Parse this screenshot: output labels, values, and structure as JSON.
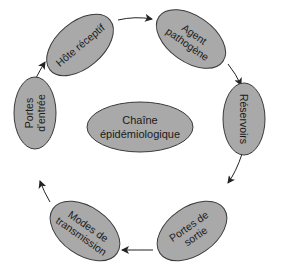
{
  "diagram": {
    "type": "cycle",
    "center": {
      "line1": "Chaîne",
      "line2": "épidémiologique"
    },
    "nodes": [
      {
        "id": "hote",
        "line1": "Hôte réceptif",
        "line2": ""
      },
      {
        "id": "agent",
        "line1": "Agent",
        "line2": "pathogène"
      },
      {
        "id": "reservoirs",
        "line1": "Réservoirs",
        "line2": ""
      },
      {
        "id": "sortie",
        "line1": "Portes de",
        "line2": "sortie"
      },
      {
        "id": "transmission",
        "line1": "Modes de",
        "line2": "transmission"
      },
      {
        "id": "entree",
        "line1": "Portes",
        "line2": "d'entrée"
      }
    ],
    "edges": [
      {
        "from": "hote",
        "to": "agent"
      },
      {
        "from": "agent",
        "to": "reservoirs"
      },
      {
        "from": "reservoirs",
        "to": "sortie"
      },
      {
        "from": "sortie",
        "to": "transmission"
      },
      {
        "from": "transmission",
        "to": "entree"
      },
      {
        "from": "entree",
        "to": "hote"
      }
    ],
    "colors": {
      "node_fill": "#a9a9a9",
      "node_stroke": "#3a3a3a",
      "text": "#1a1a1a",
      "arrow": "#222222",
      "background": "#ffffff"
    }
  }
}
